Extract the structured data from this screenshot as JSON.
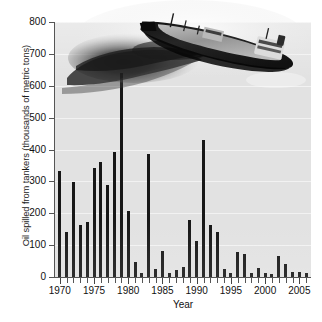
{
  "figure": {
    "background_color": "#ffffff",
    "plot_background_color": "#e2e2e2",
    "bar_color": "#171717",
    "axis_color": "#555555",
    "gridline_color": "#f2f2f2"
  },
  "photo": {
    "alt_name": "oil-tanker-with-slick-photo",
    "description": "Grayscale aerial photograph of an oil tanker leaking a dark oil slick"
  },
  "caption": {
    "text": ""
  },
  "chart_data": {
    "type": "bar",
    "title": "",
    "xlabel": "Year",
    "ylabel": "Oil spilled from tankers (thousands of metric tons)",
    "ylim": [
      0,
      800
    ],
    "xlim": [
      1969.3,
      2006.7
    ],
    "ytick_labels": [
      "0",
      "100",
      "200",
      "300",
      "400",
      "500",
      "600",
      "700",
      "800"
    ],
    "ytick_values": [
      0,
      100,
      200,
      300,
      400,
      500,
      600,
      700,
      800
    ],
    "xtick_labels": [
      "1970",
      "1975",
      "1980",
      "1985",
      "1990",
      "1995",
      "2000",
      "2005"
    ],
    "xtick_values": [
      1970,
      1975,
      1980,
      1985,
      1990,
      1995,
      2000,
      2005
    ],
    "grid": true,
    "legend": "none",
    "categories": [
      1970,
      1971,
      1972,
      1973,
      1974,
      1975,
      1976,
      1977,
      1978,
      1979,
      1980,
      1981,
      1982,
      1983,
      1984,
      1985,
      1986,
      1987,
      1988,
      1989,
      1990,
      1991,
      1992,
      1993,
      1994,
      1995,
      1996,
      1997,
      1998,
      1999,
      2000,
      2001,
      2002,
      2003,
      2004,
      2005,
      2006
    ],
    "values": [
      333,
      142,
      297,
      164,
      174,
      342,
      362,
      290,
      392,
      640,
      206,
      48,
      12,
      385,
      25,
      82,
      12,
      23,
      30,
      178,
      112,
      430,
      162,
      140,
      25,
      12,
      80,
      72,
      13,
      29,
      14,
      8,
      67,
      42,
      15,
      17,
      13
    ],
    "units": "thousands of metric tons"
  }
}
